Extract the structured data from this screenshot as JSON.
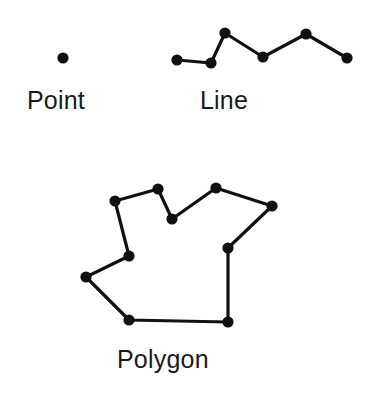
{
  "figure": {
    "background_color": "#ffffff",
    "stroke_color": "#111111",
    "node_color": "#111111",
    "text_color": "#1a1a1a",
    "stroke_width": 3.2,
    "node_radius": 5.6,
    "width": 378,
    "height": 397
  },
  "captions": {
    "point": "Point",
    "line": "Line",
    "polygon": "Polygon"
  },
  "chart_data": {
    "type": "scatter",
    "xlabel": "",
    "ylabel": "",
    "grid": false,
    "legend": "none",
    "xlim": [
      0,
      378
    ],
    "ylim": [
      397,
      0
    ],
    "series": [
      {
        "name": "Point",
        "geometry": "point",
        "label": "Point",
        "vertex_count": 1,
        "closed": false,
        "x": [
          63
        ],
        "y": [
          58
        ],
        "points": [
          [
            63,
            58
          ]
        ]
      },
      {
        "name": "Line",
        "geometry": "polyline",
        "label": "Line",
        "vertex_count": 6,
        "closed": false,
        "x": [
          177,
          211,
          225,
          263,
          306,
          347
        ],
        "y": [
          60,
          63,
          33,
          57,
          34,
          58
        ],
        "points": [
          [
            177,
            60
          ],
          [
            211,
            63
          ],
          [
            225,
            33
          ],
          [
            263,
            57
          ],
          [
            306,
            34
          ],
          [
            347,
            58
          ]
        ]
      },
      {
        "name": "Polygon",
        "geometry": "polygon",
        "label": "Polygon",
        "vertex_count": 10,
        "closed": true,
        "x": [
          115,
          158,
          172,
          216,
          272,
          228,
          228,
          129,
          86,
          129
        ],
        "y": [
          201,
          189,
          219,
          188,
          206,
          248,
          322,
          320,
          277,
          256
        ],
        "points": [
          [
            115,
            201
          ],
          [
            158,
            189
          ],
          [
            172,
            219
          ],
          [
            216,
            188
          ],
          [
            272,
            206
          ],
          [
            228,
            248
          ],
          [
            228,
            322
          ],
          [
            129,
            320
          ],
          [
            86,
            277
          ],
          [
            129,
            256
          ]
        ]
      }
    ]
  }
}
